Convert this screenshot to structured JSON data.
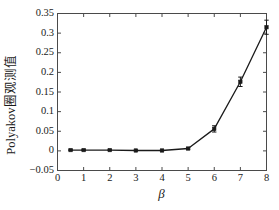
{
  "chart_data": {
    "type": "line",
    "title": "",
    "xlabel": "β",
    "ylabel": "Polyakov圈观测值",
    "xlim": [
      0,
      8
    ],
    "ylim": [
      -0.05,
      0.35
    ],
    "xticks": [
      "0",
      "1",
      "2",
      "3",
      "4",
      "5",
      "6",
      "7",
      "8"
    ],
    "xtick_values": [
      0,
      1,
      2,
      3,
      4,
      5,
      6,
      7,
      8
    ],
    "yticks": [
      "-0.05",
      "0",
      "0.05",
      "0.1",
      "0.15",
      "0.2",
      "0.25",
      "0.3",
      "0.35"
    ],
    "ytick_values": [
      -0.05,
      0,
      0.05,
      0.1,
      0.15,
      0.2,
      0.25,
      0.3,
      0.35
    ],
    "grid": false,
    "legend": "none",
    "marker": "square",
    "line_color": "#1a1a1a",
    "marker_color": "#1a1a1a",
    "errorbars": true,
    "x": [
      0.5,
      1,
      2,
      3,
      4,
      5,
      6,
      7,
      8
    ],
    "values": [
      0.002,
      0.002,
      0.002,
      0.001,
      0.001,
      0.006,
      0.056,
      0.176,
      0.315
    ],
    "yerr": [
      0.001,
      0.001,
      0.001,
      0.001,
      0.001,
      0.002,
      0.008,
      0.012,
      0.018
    ],
    "series": [
      {
        "name": "Polyakov loop",
        "x": [
          0.5,
          1,
          2,
          3,
          4,
          5,
          6,
          7,
          8
        ],
        "values": [
          0.002,
          0.002,
          0.002,
          0.001,
          0.001,
          0.006,
          0.056,
          0.176,
          0.315
        ],
        "yerr": [
          0.001,
          0.001,
          0.001,
          0.001,
          0.001,
          0.002,
          0.008,
          0.012,
          0.018
        ]
      }
    ]
  }
}
